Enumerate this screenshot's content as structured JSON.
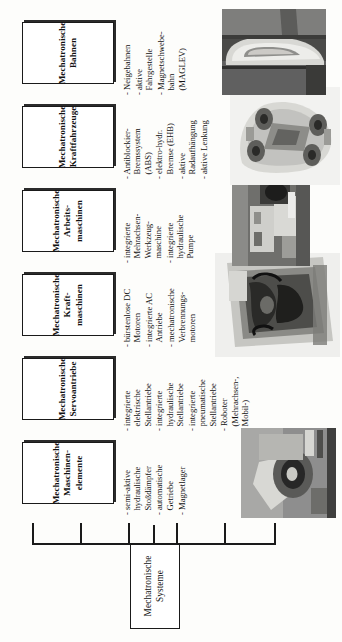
{
  "diagram": {
    "title": "Mechatronische Systeme",
    "type": "tree",
    "orientation": "rotated-90-ccw",
    "root": {
      "line1": "Mechatronische",
      "line2": "Systeme"
    },
    "branches": [
      {
        "id": "maschinenelemente",
        "box": {
          "line1": "Mechatronische",
          "line2": "Maschinen-",
          "line3": "elemente"
        },
        "bullets": [
          "- semi-aktive\nhydraulische\nStoßdämpfer",
          "- automatische\nGetriebe",
          "- Magnetlager"
        ],
        "photo": {
          "name": "magnetic-bearing-photo",
          "caption": "Magnetlager"
        }
      },
      {
        "id": "servoantriebe",
        "box": {
          "line1": "Mechatronische",
          "line2": "Servoantriebe",
          "line3": ""
        },
        "bullets": [
          "- integrierte\nelektrische\nStellantriebe",
          "- integrierte\nhydraulische\nStellantriebe",
          "- integrierte\npneumatische\nStellantriebe",
          "- Roboter\n(Mehrachsen-,\nMobil-)"
        ],
        "photo": null
      },
      {
        "id": "kraftmaschinen",
        "box": {
          "line1": "Mechatronische",
          "line2": "Kraft-",
          "line3": "maschinen"
        },
        "bullets": [
          "- bürstenlose DC\nMotoren",
          "- integrierte AC\nAntriebe",
          "- mechatronische\nVerbrennungs-\nmotoren"
        ],
        "photo": {
          "name": "combustion-engine-photo",
          "caption": "Verbrennungsmotor"
        }
      },
      {
        "id": "arbeitsmaschinen",
        "box": {
          "line1": "Mechatronische",
          "line2": "Arbeits-",
          "line3": "maschinen"
        },
        "bullets": [
          "- integrierte\nMehrachsen-\nWerkzeug-\nmaschine",
          "- integrierte\nhydraulische\nPumpe"
        ],
        "photo": {
          "name": "hydraulic-pump-photo",
          "caption": "hydraulische Pumpe"
        }
      },
      {
        "id": "kraftfahrzeuge",
        "box": {
          "line1": "Mechatronische",
          "line2": "Kraftfahrzeuge",
          "line3": ""
        },
        "bullets": [
          "- Antiblockier-\nBremssystem\n(ABS)",
          "- elektro-hydr.\nBremse (EHB)",
          "- aktive\nRadaufhängung",
          "- aktive Lenkung"
        ],
        "photo": {
          "name": "car-chassis-photo",
          "caption": "Kraftfahrzeug"
        }
      },
      {
        "id": "bahnen",
        "box": {
          "line1": "Mechatronische",
          "line2": "Bahnen",
          "line3": ""
        },
        "bullets": [
          "- Neigebahnen",
          "- aktive\nFahrgestelle",
          "- Magnetschwebe-\nbahn\n(MAGLEV)"
        ],
        "photo": {
          "name": "maglev-train-photo",
          "caption": "Magnetschwebebahn"
        }
      }
    ],
    "colors": {
      "line": "#1a1a1a",
      "box_fill": "#ffffff",
      "text": "#111111",
      "background": "#fdfdfb"
    }
  }
}
